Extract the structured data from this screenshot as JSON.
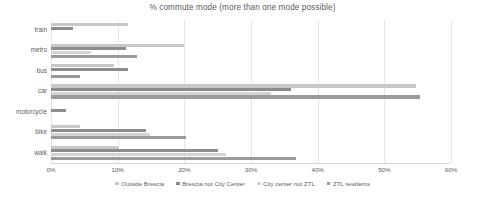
{
  "chart_data": {
    "type": "bar",
    "orientation": "horizontal",
    "title": "% commute mode (more than one mode possible)",
    "xlabel": "",
    "ylabel": "",
    "xlim": [
      0,
      60
    ],
    "xticks": [
      "0%",
      "10%",
      "20%",
      "30%",
      "40%",
      "50%",
      "60%"
    ],
    "xtick_values": [
      0,
      10,
      20,
      30,
      40,
      50,
      60
    ],
    "grid": true,
    "legend_position": "bottom",
    "categories": [
      "train",
      "metro",
      "bus",
      "car",
      "motorcycle",
      "bike",
      "walk"
    ],
    "series": [
      {
        "name": "Outside Brescia",
        "color": "#c8c8c8",
        "values": [
          11.6,
          20.0,
          9.5,
          54.7,
          0.0,
          4.4,
          10.2
        ]
      },
      {
        "name": "Brescia not City Center",
        "color": "#8c8c8c",
        "values": [
          3.3,
          11.3,
          11.6,
          36.0,
          2.3,
          14.3,
          25.1
        ]
      },
      {
        "name": "City center not ZTL",
        "color": "#d4d4d4",
        "values": [
          0.0,
          6.0,
          0.0,
          33.0,
          0.0,
          14.9,
          26.3
        ]
      },
      {
        "name": "ZTL residents",
        "color": "#9a9a9a",
        "values": [
          0.0,
          12.9,
          4.4,
          55.3,
          0.0,
          20.2,
          36.7
        ]
      }
    ]
  },
  "accent_colors": {
    "series_1": "#c8c8c8",
    "series_2": "#8c8c8c",
    "series_3": "#d4d4d4",
    "series_4": "#9a9a9a",
    "gridline": "#e6e6e6",
    "axis": "#d9d9d9",
    "text": "#606060",
    "background": "#ffffff"
  }
}
